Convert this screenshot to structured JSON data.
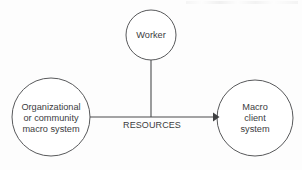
{
  "diagram": {
    "nodes": [
      {
        "id": "organizational-macro-system",
        "name": "Organizational or community macro system",
        "lines": [
          "Organizational",
          "or community",
          "macro system"
        ],
        "shape": "circle",
        "cx": 51,
        "cy": 117,
        "r": 39
      },
      {
        "id": "worker",
        "name": "Worker",
        "lines": [
          "Worker"
        ],
        "shape": "circle",
        "cx": 151,
        "cy": 35,
        "r": 25
      },
      {
        "id": "macro-client-system",
        "name": "Macro client system",
        "lines": [
          "Macro",
          "client",
          "system"
        ],
        "shape": "circle",
        "cx": 255,
        "cy": 118,
        "r": 38
      }
    ],
    "edges": [
      {
        "id": "resources-arrow",
        "label": "RESOURCES",
        "from": "organizational-macro-system",
        "to": "macro-client-system",
        "style": "arrow",
        "direction": "right"
      },
      {
        "id": "worker-connector",
        "label": "",
        "from": "worker",
        "to": "resources-arrow",
        "style": "line",
        "direction": "none"
      }
    ],
    "colors": {
      "stroke": "#58595b",
      "text": "#3b3c3e",
      "arrow_fill": "#3f4042",
      "background": "#fdfdfd"
    }
  }
}
